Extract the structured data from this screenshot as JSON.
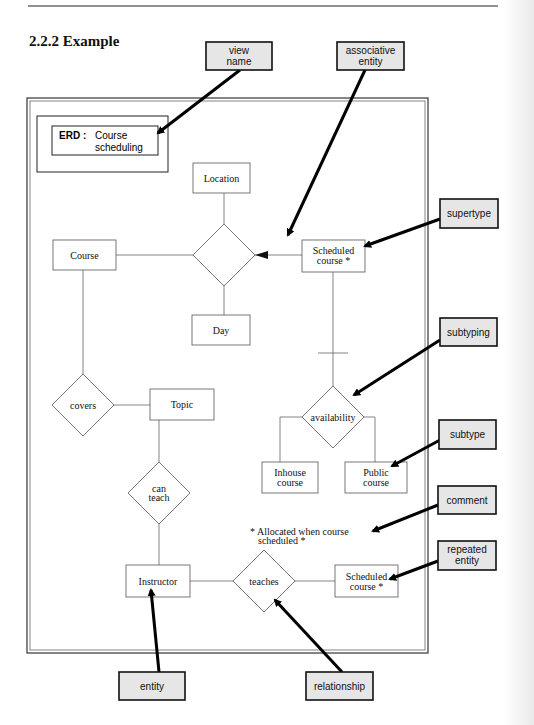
{
  "section": {
    "title": "2.2.2  Example"
  },
  "view_name_box": {
    "label_bold": "ERD :",
    "label_line1": "Course",
    "label_line2": "scheduling"
  },
  "entities": {
    "location": "Location",
    "course": "Course",
    "day": "Day",
    "scheduled_course_1": [
      "Scheduled",
      "course *"
    ],
    "topic": "Topic",
    "inhouse_course": [
      "Inhouse",
      "course"
    ],
    "public_course": [
      "Public",
      "course"
    ],
    "instructor": "Instructor",
    "scheduled_course_2": [
      "Scheduled",
      "course *"
    ]
  },
  "relationships": {
    "associative": "",
    "covers": "covers",
    "availability": "availability",
    "can_teach": [
      "can",
      "teach"
    ],
    "teaches": "teaches"
  },
  "comment_text": [
    "* Allocated when course",
    "scheduled *"
  ],
  "callouts": {
    "view_name": [
      "view",
      "name"
    ],
    "associative_entity": [
      "associative",
      "entity"
    ],
    "supertype": "supertype",
    "subtyping": "subtyping",
    "subtype": "subtype",
    "comment": "comment",
    "repeated_entity": [
      "repeated",
      "entity"
    ],
    "entity": "entity",
    "relationship": "relationship"
  },
  "colors": {
    "callout_fill": "#e6e6e6",
    "line": "#666666",
    "arrow": "#000000"
  }
}
